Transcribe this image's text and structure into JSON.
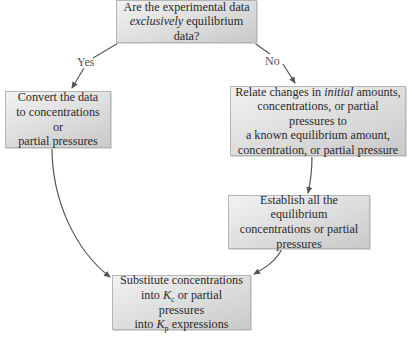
{
  "flowchart": {
    "question": {
      "line1": "Are the experimental data",
      "line2_italic": "exclusively",
      "line2_rest": " equilibrium data?"
    },
    "branch_yes": "Yes",
    "branch_no": "No",
    "convert_box": {
      "line1": "Convert the data",
      "line2": "to concentrations or",
      "line3": "partial pressures"
    },
    "relate_box": {
      "line1_pre": "Relate changes in ",
      "line1_italic": "initial",
      "line1_post": " amounts,",
      "line2": "concentrations, or partial pressures to",
      "line3": "a known equilibrium amount,",
      "line4": "concentration, or partial pressure"
    },
    "establish_box": {
      "line1": "Establish all the equilibrium",
      "line2": "concentrations or partial",
      "line3": "pressures"
    },
    "substitute_box": {
      "line1": "Substitute concentrations",
      "line2_pre": "into ",
      "kc_symbol": "K",
      "kc_sub": "c",
      "line2_post": " or partial pressures",
      "line3_pre": "into ",
      "kp_symbol": "K",
      "kp_sub": "p",
      "line3_post": " expressions"
    },
    "colors": {
      "box_light": "#f2f2f2",
      "box_dark": "#c9c9c9",
      "border": "#b5b5b5",
      "arrow": "#555555",
      "text": "#2a2a2a"
    }
  }
}
